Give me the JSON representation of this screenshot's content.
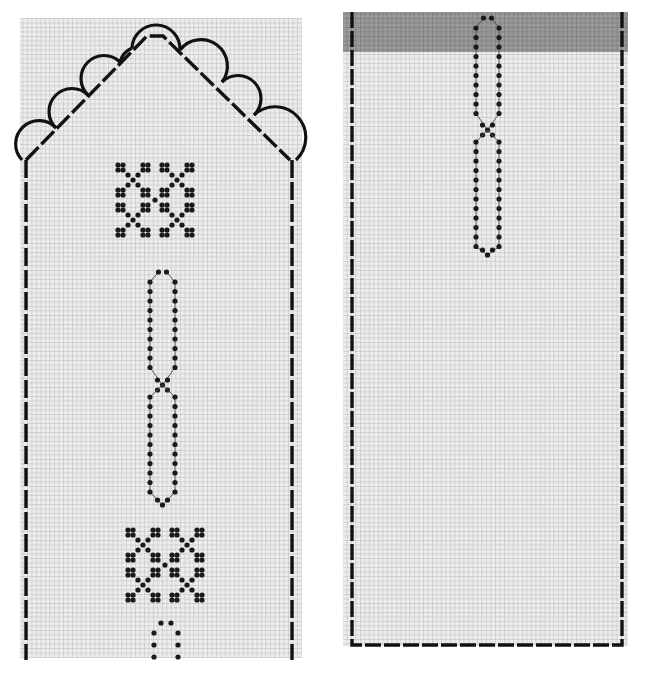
{
  "title": "",
  "colors": {
    "background": "#ffffff",
    "grid_fill": "#e4e4e4",
    "grid_line": "#b4b4b4",
    "grid_line_light": "#cfcfcf",
    "stroke": "#111111",
    "dot": "#1a1a1a",
    "dot_connector": "#555555",
    "shaded_band": "#8a8a8a"
  },
  "panels": [
    {
      "id": "left-panel",
      "description": "Pointed-top chart with scalloped edging, two cross-stitch motifs and a chain-loop column",
      "grid": {
        "x": 20,
        "y": 18,
        "w": 282,
        "h": 640,
        "cell": 4.5
      },
      "outline": {
        "style": "dashed",
        "apex": [
          155,
          36
        ],
        "left_shoulder": [
          25,
          160
        ],
        "right_shoulder": [
          290,
          160
        ],
        "bottom_y": 658
      },
      "scallops": {
        "left": [
          [
            32,
            148
          ],
          [
            63,
            115
          ],
          [
            95,
            82
          ],
          [
            127,
            50
          ]
        ],
        "right": [
          [
            183,
            50
          ],
          [
            215,
            82
          ],
          [
            247,
            115
          ],
          [
            280,
            148
          ]
        ],
        "top": [
          155,
          40
        ],
        "radius": 22
      },
      "cross_motifs": [
        {
          "cx": 155,
          "cy": 200
        },
        {
          "cx": 165,
          "cy": 565
        }
      ],
      "loop_columns": [
        {
          "x_left": 150,
          "x_right": 175,
          "y_top": 272,
          "y_mid": 385,
          "y_bottom": 505
        }
      ],
      "partial_loop": {
        "x_left": 154,
        "x_right": 178,
        "y_top": 623,
        "y_bottom": 660
      }
    },
    {
      "id": "right-panel",
      "description": "Rectangular chart with shaded top band and a single chain-loop column",
      "grid": {
        "x": 343,
        "y": 12,
        "w": 285,
        "h": 634
      },
      "shaded_band": {
        "y": 12,
        "h": 40
      },
      "outline": {
        "style": "dashed",
        "x_left": 352,
        "x_right": 622,
        "y_top": 12,
        "y_bottom": 645
      },
      "loop_columns": [
        {
          "x_left": 476,
          "x_right": 499,
          "y_top": 18,
          "y_mid": 130,
          "y_bottom": 255
        }
      ]
    }
  ]
}
